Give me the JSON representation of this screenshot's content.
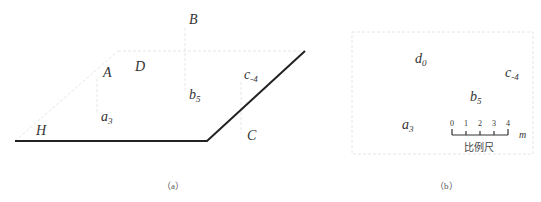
{
  "figure_a": {
    "caption": "（a）",
    "labels": {
      "B": "B",
      "A": "A",
      "D": "D",
      "c": "c",
      "c_sub": "-4",
      "b": "b",
      "b_sub": "5",
      "a": "a",
      "a_sub": "3",
      "H": "H",
      "C": "C"
    }
  },
  "figure_b": {
    "caption": "（b）",
    "labels": {
      "d": "d",
      "d_sub": "0",
      "c": "c",
      "c_sub": "-4",
      "b": "b",
      "b_sub": "5",
      "a": "a",
      "a_sub": "3"
    },
    "scale_bar": {
      "ticks": [
        "0",
        "1",
        "2",
        "3",
        "4"
      ],
      "unit": "m",
      "title": "比例尺"
    }
  },
  "colors": {
    "line": "#222222",
    "faint_line": "#e6e6e6",
    "text": "#333333"
  }
}
